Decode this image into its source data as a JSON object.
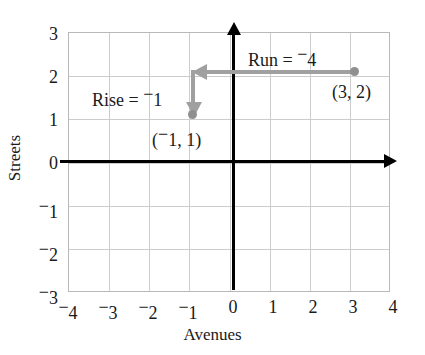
{
  "chart_data": {
    "type": "scatter",
    "title": "",
    "xlabel": "Avenues",
    "ylabel": "Streets",
    "xlim": [
      -4,
      4
    ],
    "ylim": [
      -3,
      3
    ],
    "grid": true,
    "legend": "none",
    "x_ticks": [
      {
        "value": -4,
        "label": "4",
        "negative": true
      },
      {
        "value": -3,
        "label": "3",
        "negative": true
      },
      {
        "value": -2,
        "label": "2",
        "negative": true
      },
      {
        "value": -1,
        "label": "1",
        "negative": true
      },
      {
        "value": 0,
        "label": "0",
        "negative": false
      },
      {
        "value": 1,
        "label": "1",
        "negative": false
      },
      {
        "value": 2,
        "label": "2",
        "negative": false
      },
      {
        "value": 3,
        "label": "3",
        "negative": false
      },
      {
        "value": 4,
        "label": "4",
        "negative": false
      }
    ],
    "y_ticks": [
      {
        "value": 3,
        "label": "3",
        "negative": false
      },
      {
        "value": 2,
        "label": "2",
        "negative": false
      },
      {
        "value": 1,
        "label": "1",
        "negative": false
      },
      {
        "value": 0,
        "label": "0",
        "negative": false
      },
      {
        "value": -1,
        "label": "1",
        "negative": true
      },
      {
        "value": -2,
        "label": "2",
        "negative": true
      },
      {
        "value": -3,
        "label": "3",
        "negative": true
      }
    ],
    "points": [
      {
        "name": "point-3-2",
        "x": 3,
        "y": 2,
        "label": "(3, 2)"
      },
      {
        "name": "point-neg1-1",
        "x": -1,
        "y": 1,
        "label": "(⁻1, 1)"
      }
    ],
    "annotations": [
      {
        "name": "run",
        "text": "Run = ⁻4",
        "value": -4,
        "from": [
          3,
          2
        ],
        "to": [
          -1,
          2
        ],
        "direction": "left"
      },
      {
        "name": "rise",
        "text": "Rise = ⁻1",
        "value": -1,
        "from": [
          -1,
          2
        ],
        "to": [
          -1,
          1
        ],
        "direction": "down"
      }
    ],
    "colors": {
      "axis": "#000000",
      "grid": "#cccccc",
      "annotation": "#a0a0a0",
      "point": "#8f8f8f",
      "background": "#ffffff",
      "text": "#1a1a1a"
    }
  },
  "labels": {
    "x_axis_title": "Avenues",
    "y_axis_title": "Streets",
    "run_text": "Run = ⁻4",
    "rise_text": "Rise = ⁻1",
    "point_a_label": "(3, 2)",
    "point_b_label": "(⁻1, 1)"
  },
  "ticks": {
    "y": [
      "3",
      "2",
      "1",
      "0",
      "⁻1",
      "⁻2",
      "⁻3"
    ],
    "x": [
      "⁻4",
      "⁻3",
      "⁻2",
      "⁻1",
      "0",
      "1",
      "2",
      "3",
      "4"
    ]
  }
}
